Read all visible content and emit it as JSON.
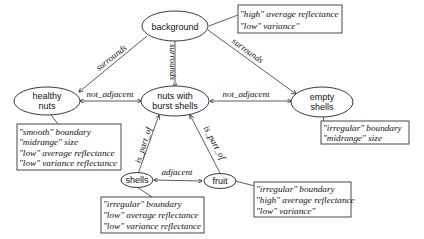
{
  "diagram": {
    "nodes": {
      "background": {
        "label": "background"
      },
      "healthy_nuts": {
        "line1": "healthy",
        "line2": "nuts"
      },
      "nuts_burst": {
        "line1": "nuts with",
        "line2": "burst shells"
      },
      "empty_shells": {
        "line1": "empty",
        "line2": "shells"
      },
      "shells": {
        "label": "shells"
      },
      "fruit": {
        "label": "fruit"
      }
    },
    "edges": {
      "bg_healthy": "surrounds",
      "bg_burst": "surrounds",
      "bg_empty": "surrounds",
      "healthy_burst": "not_adjacent",
      "burst_empty": "not_adjacent",
      "shells_burst": "is_part_of",
      "fruit_burst": "is_part_of",
      "shells_fruit": "adjacent"
    },
    "attributes": {
      "background": [
        "\"high\" average reflectance",
        "\"low\" variance\""
      ],
      "healthy_nuts": [
        "\"smooth\" boundary",
        "\"midrange\" size",
        "\"low\" average reflectance",
        "\"low\" variance reflectance"
      ],
      "empty_shells": [
        "\"irregular\" boundary",
        "\"midrange\" size"
      ],
      "shells": [
        "\"irregular\" boundary",
        "\"low\" average reflectance",
        "\"low\" variance reflectance"
      ],
      "fruit": [
        "\"irregular\" boundary",
        "\"high\" average reflectance",
        "\"low\" variance\""
      ]
    }
  }
}
